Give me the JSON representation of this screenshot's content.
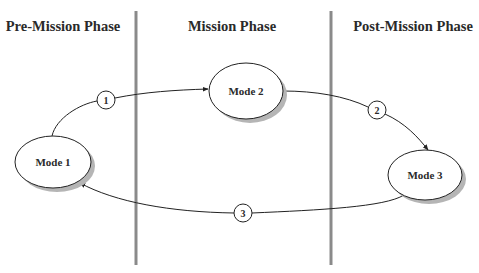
{
  "diagram": {
    "type": "state-transition",
    "phases": [
      {
        "id": "pre",
        "label": "Pre-Mission Phase",
        "center_x": 63
      },
      {
        "id": "mission",
        "label": "Mission Phase",
        "center_x": 232
      },
      {
        "id": "post",
        "label": "Post-Mission Phase",
        "center_x": 413
      }
    ],
    "dividers": [
      {
        "x": 136,
        "y1": 11,
        "y2": 265
      },
      {
        "x": 331,
        "y1": 11,
        "y2": 265
      }
    ],
    "nodes": [
      {
        "id": "mode1",
        "label": "Mode 1",
        "phase": "pre",
        "cx": 53,
        "cy": 162,
        "rx": 38,
        "ry": 26
      },
      {
        "id": "mode2",
        "label": "Mode 2",
        "phase": "mission",
        "cx": 246,
        "cy": 91,
        "rx": 37,
        "ry": 28
      },
      {
        "id": "mode3",
        "label": "Mode 3",
        "phase": "post",
        "cx": 425,
        "cy": 175,
        "rx": 37,
        "ry": 25
      }
    ],
    "transitions": [
      {
        "step": "1",
        "from": "mode1",
        "to": "mode2",
        "marker_cx": 106,
        "marker_cy": 100
      },
      {
        "step": "2",
        "from": "mode2",
        "to": "mode3",
        "marker_cx": 377,
        "marker_cy": 110
      },
      {
        "step": "3",
        "from": "mode3",
        "to": "mode1",
        "marker_cx": 243,
        "marker_cy": 213
      }
    ],
    "colors": {
      "divider": "#8a8a8a",
      "stroke": "#222222",
      "shadow": "#b5b5b5",
      "text": "#2a2a2a"
    }
  }
}
